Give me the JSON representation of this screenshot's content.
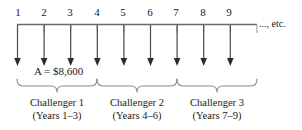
{
  "figure": {
    "type": "cash-flow-timeline-diagram",
    "amount_label": "A = $8,600",
    "continuation_label": "..., etc.",
    "axis": {
      "tick_labels": [
        "1",
        "2",
        "3",
        "4",
        "5",
        "6",
        "7",
        "8",
        "9"
      ],
      "arrow_count": 9,
      "arrow_direction": "down"
    },
    "groups": [
      {
        "name": "Challenger 1",
        "years": "(Years 1–3)"
      },
      {
        "name": "Challenger 2",
        "years": "(Years 4–6)"
      },
      {
        "name": "Challenger 3",
        "years": "(Years 7–9)"
      }
    ],
    "colors": {
      "line": "#6b6b6b",
      "arrow": "#4a4a4a",
      "brace": "#8a8a8a",
      "text": "#1a1a1a",
      "background": "#ffffff"
    }
  }
}
